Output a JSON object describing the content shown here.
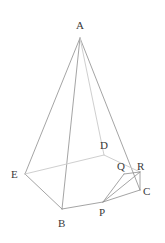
{
  "figure": {
    "type": "geometry-diagram",
    "width": 165,
    "height": 243,
    "background_color": "#ffffff",
    "solid_line_color": "#8d8d8d",
    "hidden_line_color": "#cfcfcf",
    "label_color": "#3a3a3a",
    "vertices": [
      {
        "id": "A",
        "label": "A",
        "x": 80,
        "y": 38,
        "label_x": 76,
        "label_y": 20
      },
      {
        "id": "E",
        "label": "E",
        "x": 25,
        "y": 174,
        "label_x": 11,
        "label_y": 169
      },
      {
        "id": "B",
        "label": "B",
        "x": 62,
        "y": 209,
        "label_x": 58,
        "label_y": 218
      },
      {
        "id": "P",
        "label": "P",
        "x": 103,
        "y": 202,
        "label_x": 99,
        "label_y": 207
      },
      {
        "id": "C",
        "label": "C",
        "x": 140,
        "y": 190,
        "label_x": 143,
        "label_y": 186
      },
      {
        "id": "R",
        "label": "R",
        "x": 140,
        "y": 172,
        "label_x": 137,
        "label_y": 161
      },
      {
        "id": "Q",
        "label": "Q",
        "x": 124,
        "y": 174,
        "label_x": 117,
        "label_y": 161
      },
      {
        "id": "D",
        "label": "D",
        "x": 104,
        "y": 155,
        "label_x": 100,
        "label_y": 140
      }
    ],
    "edges": [
      {
        "id": "edge-A-E",
        "from": "A",
        "to": "E",
        "style": "solid"
      },
      {
        "id": "edge-A-B",
        "from": "A",
        "to": "B",
        "style": "solid"
      },
      {
        "id": "edge-A-C",
        "from": "A",
        "to": "C",
        "style": "solid"
      },
      {
        "id": "edge-A-D",
        "from": "A",
        "to": "D",
        "style": "hidden"
      },
      {
        "id": "edge-E-B",
        "from": "E",
        "to": "B",
        "style": "solid"
      },
      {
        "id": "edge-B-P",
        "from": "B",
        "to": "P",
        "style": "solid"
      },
      {
        "id": "edge-P-C",
        "from": "P",
        "to": "C",
        "style": "solid"
      },
      {
        "id": "edge-C-R",
        "from": "C",
        "to": "R",
        "style": "solid"
      },
      {
        "id": "edge-R-D",
        "from": "R",
        "to": "D",
        "style": "hidden"
      },
      {
        "id": "edge-D-E",
        "from": "D",
        "to": "E",
        "style": "hidden"
      },
      {
        "id": "edge-P-Q",
        "from": "P",
        "to": "Q",
        "style": "solid"
      },
      {
        "id": "edge-Q-R",
        "from": "Q",
        "to": "R",
        "style": "solid"
      },
      {
        "id": "edge-P-R",
        "from": "P",
        "to": "R",
        "style": "solid"
      }
    ]
  }
}
